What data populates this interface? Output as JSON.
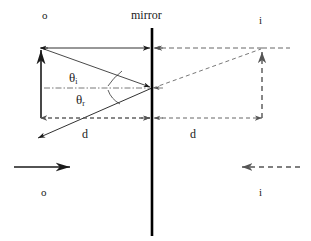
{
  "diagram": {
    "type": "optics-ray-diagram",
    "background_color": "#ffffff",
    "stroke_color": "#1a1a1a",
    "mirror_color": "#000000",
    "dashed_color": "#555555"
  },
  "labels": {
    "object_top": "o",
    "mirror": "mirror",
    "image_top": "i",
    "theta_incident": "θ",
    "theta_incident_sub": "i",
    "theta_reflected": "θ",
    "theta_reflected_sub": "r",
    "distance_left": "d",
    "distance_right": "d",
    "object_bottom": "o",
    "image_bottom": "i"
  },
  "geometry": {
    "mirror_x": 152,
    "mirror_y_top": 28,
    "mirror_y_bottom": 236,
    "object_tip_x": 41,
    "object_tip_y": 48,
    "object_base_x": 41,
    "object_base_y": 118,
    "image_tip_x": 262,
    "image_tip_y": 48,
    "image_base_x": 262,
    "image_base_y": 118,
    "reflection_point_x": 152,
    "reflection_point_y": 88,
    "reflected_ray_end_x": 36,
    "reflected_ray_end_y": 139,
    "top_line_y": 48,
    "bottom_line_y": 118,
    "normal_line_y": 88,
    "bottom_arrow_object_y": 167,
    "bottom_arrow_object_x1": 14,
    "bottom_arrow_object_x2": 72,
    "bottom_arrow_image_y": 167,
    "bottom_arrow_image_x1": 300,
    "bottom_arrow_image_x2": 240
  }
}
